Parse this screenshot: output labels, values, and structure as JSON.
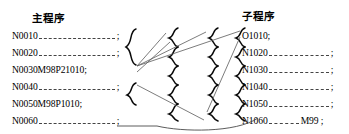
{
  "diagram": {
    "type": "cnc-subprogram-call-flow",
    "background_color": "#ffffff",
    "text_color": "#000000",
    "brace_color": "#0a0a0a",
    "arrow_color": "#5a5a5a"
  },
  "main_program": {
    "title": "主程序",
    "lines": [
      {
        "label": "N0010",
        "rule": true,
        "tail": ";"
      },
      {
        "label": "N0020",
        "rule": true,
        "tail": ";"
      },
      {
        "label": "N0030M98P21010;",
        "rule": false,
        "tail": ""
      },
      {
        "label": "N0040",
        "rule": true,
        "tail": ";"
      },
      {
        "label": "N0050M98P1010;",
        "rule": false,
        "tail": ""
      },
      {
        "label": "N0060",
        "rule": true,
        "tail": ";"
      }
    ]
  },
  "subprogram": {
    "title": "子程序",
    "lines": [
      {
        "label": "O1010;",
        "rule": false,
        "tail": ""
      },
      {
        "label": "N1020",
        "rule": true,
        "tail": ";"
      },
      {
        "label": "N1030",
        "rule": true,
        "tail": ";"
      },
      {
        "label": "N1040",
        "rule": true,
        "tail": ";"
      },
      {
        "label": "N1050",
        "rule": true,
        "tail": ";"
      },
      {
        "label": "N1060",
        "rule": true,
        "tail": "M99 ;"
      }
    ]
  },
  "flow": {
    "call_arrow_labels": [
      "call-1",
      "call-2",
      "call-3"
    ],
    "return_arrow_label": "return-M99"
  }
}
